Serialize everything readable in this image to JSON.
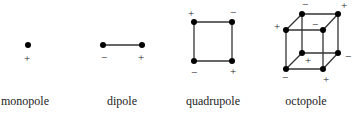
{
  "colors": {
    "stroke": "#333333",
    "dot": "#000000",
    "text": "#222222",
    "background": "#ffffff"
  },
  "figures": [
    {
      "id": "monopole",
      "caption": "monopole",
      "caption_x": 25,
      "charges": [
        {
          "x": 28,
          "y": 45,
          "sign": "+",
          "label_x": 27,
          "label_y": 62
        }
      ],
      "edges": []
    },
    {
      "id": "dipole",
      "caption": "dipole",
      "caption_x": 122,
      "charges": [
        {
          "x": 103,
          "y": 45,
          "sign": "−",
          "label_x": 104,
          "label_y": 61
        },
        {
          "x": 142,
          "y": 45,
          "sign": "+",
          "label_x": 141,
          "label_y": 61
        }
      ],
      "edges": [
        [
          0,
          1
        ]
      ]
    },
    {
      "id": "quadrupole",
      "caption": "quadrupole",
      "caption_x": 213,
      "charges": [
        {
          "x": 194,
          "y": 22,
          "sign": "+",
          "label_x": 191,
          "label_y": 17
        },
        {
          "x": 232,
          "y": 22,
          "sign": "−",
          "label_x": 233,
          "label_y": 16
        },
        {
          "x": 232,
          "y": 61,
          "sign": "+",
          "label_x": 233,
          "label_y": 75
        },
        {
          "x": 194,
          "y": 61,
          "sign": "−",
          "label_x": 194,
          "label_y": 76
        }
      ],
      "edges": [
        [
          0,
          1
        ],
        [
          1,
          2
        ],
        [
          2,
          3
        ],
        [
          3,
          0
        ]
      ]
    },
    {
      "id": "octopole",
      "caption": "octopole",
      "caption_x": 306,
      "charges": [
        {
          "x": 302,
          "y": 14,
          "sign": "−",
          "label_x": 305,
          "label_y": 8
        },
        {
          "x": 338,
          "y": 14,
          "sign": "+",
          "label_x": 344,
          "label_y": 9
        },
        {
          "x": 286,
          "y": 30,
          "sign": "+",
          "label_x": 277,
          "label_y": 30
        },
        {
          "x": 323,
          "y": 30,
          "sign": "−",
          "label_x": 315,
          "label_y": 28
        },
        {
          "x": 302,
          "y": 53,
          "sign": "+",
          "label_x": 308,
          "label_y": 64
        },
        {
          "x": 338,
          "y": 53,
          "sign": "−",
          "label_x": 348,
          "label_y": 60
        },
        {
          "x": 286,
          "y": 69,
          "sign": "−",
          "label_x": 285,
          "label_y": 81
        },
        {
          "x": 323,
          "y": 69,
          "sign": "+",
          "label_x": 326,
          "label_y": 83
        }
      ],
      "edges": [
        [
          0,
          1
        ],
        [
          2,
          3
        ],
        [
          0,
          2
        ],
        [
          1,
          3
        ],
        [
          4,
          5
        ],
        [
          6,
          7
        ],
        [
          4,
          6
        ],
        [
          5,
          7
        ],
        [
          0,
          4
        ],
        [
          1,
          5
        ],
        [
          2,
          6
        ],
        [
          3,
          7
        ]
      ]
    }
  ]
}
